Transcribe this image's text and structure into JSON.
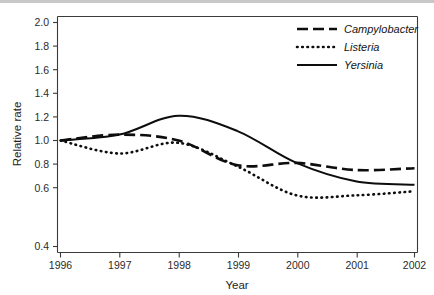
{
  "chart_data": {
    "type": "line",
    "title": "",
    "xlabel": "Year",
    "ylabel": "Relative rate",
    "x": [
      1996,
      1997,
      1998,
      1999,
      2000,
      2001,
      2002
    ],
    "categories": [
      "1996",
      "1997",
      "1998",
      "1999",
      "2000",
      "2001",
      "2002"
    ],
    "xlim": [
      1996,
      2002
    ],
    "ylim": [
      0.4,
      2.0
    ],
    "yticks": [
      0.4,
      0.6,
      0.8,
      1.0,
      1.2,
      1.4,
      1.6,
      1.8,
      2.0
    ],
    "ytick_labels": [
      "0.4",
      "0.6",
      "0.8",
      "1.0",
      "1.2",
      "1.4",
      "1.6",
      "1.8",
      "2.0"
    ],
    "xtick_labels": [
      "1996",
      "1997",
      "1998",
      "1999",
      "2000",
      "2001",
      "2002"
    ],
    "grid": false,
    "legend_position": "top-right",
    "series": [
      {
        "name": "Campylobacter",
        "style": "dashed",
        "color": "#0d0d0d",
        "values": [
          1.0,
          1.05,
          1.0,
          0.79,
          0.81,
          0.75,
          0.765
        ]
      },
      {
        "name": "Listeria",
        "style": "dotted",
        "color": "#0d0d0d",
        "values": [
          1.0,
          0.89,
          0.98,
          0.78,
          0.535,
          0.535,
          0.57
        ]
      },
      {
        "name": "Yersinia",
        "style": "solid",
        "color": "#0d0d0d",
        "values": [
          1.0,
          1.05,
          1.21,
          1.08,
          0.81,
          0.655,
          0.625
        ]
      }
    ]
  },
  "legend": {
    "items": [
      {
        "label": "Campylobacter",
        "style": "dashed"
      },
      {
        "label": "Listeria",
        "style": "dotted"
      },
      {
        "label": "Yersinia",
        "style": "solid"
      }
    ]
  },
  "axes": {
    "y_title": "Relative rate",
    "x_title": "Year"
  }
}
